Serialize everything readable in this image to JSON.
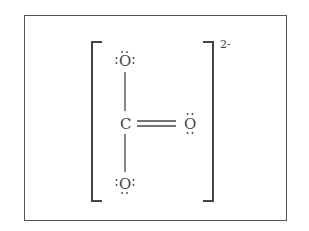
{
  "diagram": {
    "charge": "2-",
    "atoms": {
      "central": "C",
      "top_oxygen": "O",
      "right_oxygen": "O",
      "bottom_oxygen": "O"
    },
    "bonds": [
      {
        "from": "C",
        "to": "top_oxygen",
        "order": 1
      },
      {
        "from": "C",
        "to": "right_oxygen",
        "order": 2
      },
      {
        "from": "C",
        "to": "bottom_oxygen",
        "order": 1
      }
    ],
    "lone_pairs": {
      "top_oxygen": 3,
      "right_oxygen": 2,
      "bottom_oxygen": 3
    },
    "colors": {
      "line": "#444444",
      "frame": "#555555",
      "background": "#ffffff"
    }
  }
}
